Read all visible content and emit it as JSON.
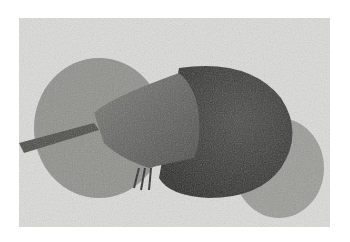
{
  "image": {
    "subject": "horseshoe crab on sand",
    "alt": "Black and white photograph of a horseshoe crab partially dug into beach sand",
    "colors": {
      "background": "#ffffff",
      "sand": "#dcdcda",
      "sand_mound": "#8a8a86",
      "shell_dark": "#3a3a38",
      "shell_mid": "#5a5a56",
      "tail": "#4a4a46"
    }
  }
}
